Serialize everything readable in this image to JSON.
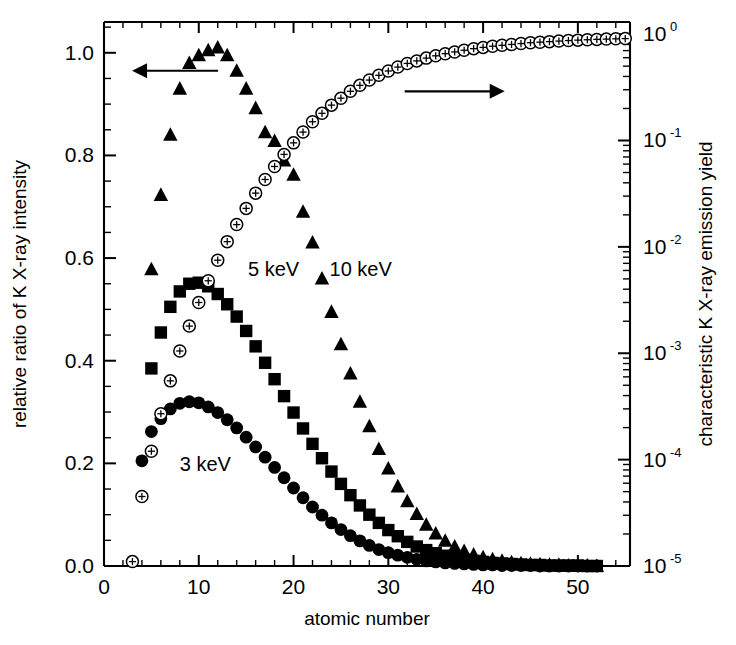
{
  "chart_data": {
    "type": "scatter",
    "title": "",
    "xlabel": "atomic number",
    "ylabel": "relative ratio of K X-ray intensity",
    "y2label": "characteristic K X-ray emission yield",
    "xlim": [
      0,
      55.5
    ],
    "xticks": [
      0,
      10,
      20,
      30,
      40,
      50
    ],
    "xticklabels": [
      "0",
      "10",
      "20",
      "30",
      "40",
      "50"
    ],
    "x_minor_step": 2,
    "ylim": [
      0.0,
      1.06
    ],
    "yticks": [
      0.0,
      0.2,
      0.4,
      0.6,
      0.8,
      1.0
    ],
    "yticklabels": [
      "0.0",
      "0.2",
      "0.4",
      "0.6",
      "0.8",
      "1.0"
    ],
    "y_minor_step": 0.05,
    "y2_log": true,
    "y2lim": [
      1e-05,
      1.3
    ],
    "y2ticks": [
      1e-05,
      0.0001,
      0.001,
      0.01,
      0.1,
      1
    ],
    "y2ticklabels": [
      "10-5",
      "10-4",
      "10-3",
      "10-2",
      "10-1",
      "100"
    ],
    "y2tick_mantissas": [
      "10",
      "10",
      "10",
      "10",
      "10",
      "10"
    ],
    "y2tick_exponents": [
      "-5",
      "-4",
      "-3",
      "-2",
      "-1",
      "0"
    ],
    "grid": false,
    "legend_position": "inline-annotations",
    "annotations": [
      {
        "name": "left-axis-arrow",
        "text": "",
        "symbol": "arrow-left",
        "x_data": 7.5,
        "y_data": 0.965,
        "length_px": 86
      },
      {
        "name": "right-axis-arrow",
        "text": "",
        "symbol": "arrow-right",
        "x_data": 37.0,
        "y_data": 0.925,
        "length_px": 100
      }
    ],
    "series": [
      {
        "name": "3 keV",
        "label": "3 keV",
        "marker": "filled-circle",
        "axis": "left",
        "color": "#000000",
        "label_x_data": 8.0,
        "label_y_data": 0.185,
        "x": [
          4,
          5,
          6,
          7,
          8,
          9,
          10,
          11,
          12,
          13,
          14,
          15,
          16,
          17,
          18,
          19,
          20,
          21,
          22,
          23,
          24,
          25,
          26,
          27,
          28,
          29,
          30,
          31,
          32,
          33,
          34,
          35,
          36,
          37,
          38,
          39,
          40,
          41,
          42,
          43,
          44,
          45,
          46,
          47,
          48,
          49,
          50,
          51,
          52
        ],
        "y": [
          0.205,
          0.262,
          0.287,
          0.306,
          0.317,
          0.32,
          0.318,
          0.31,
          0.299,
          0.285,
          0.269,
          0.251,
          0.232,
          0.212,
          0.192,
          0.172,
          0.152,
          0.133,
          0.115,
          0.099,
          0.084,
          0.071,
          0.059,
          0.049,
          0.04,
          0.032,
          0.026,
          0.021,
          0.017,
          0.013,
          0.01,
          0.008,
          0.006,
          0.005,
          0.004,
          0.003,
          0.002,
          0.002,
          0.001,
          0.001,
          0.001,
          0.001,
          0.0,
          0.0,
          0.0,
          0.0,
          0.0,
          0.0,
          0.0
        ]
      },
      {
        "name": "5 keV",
        "label": "5 keV",
        "marker": "filled-square",
        "axis": "left",
        "color": "#000000",
        "label_x_data": 15.2,
        "label_y_data": 0.565,
        "x": [
          5,
          6,
          7,
          8,
          9,
          10,
          11,
          12,
          13,
          14,
          15,
          16,
          17,
          18,
          19,
          20,
          21,
          22,
          23,
          24,
          25,
          26,
          27,
          28,
          29,
          30,
          31,
          32,
          33,
          34,
          35,
          36,
          37,
          38,
          39,
          40,
          41,
          42,
          43,
          44,
          45,
          46,
          47,
          48,
          49,
          50,
          51,
          52
        ],
        "y": [
          0.385,
          0.455,
          0.505,
          0.535,
          0.55,
          0.552,
          0.545,
          0.53,
          0.51,
          0.486,
          0.458,
          0.428,
          0.396,
          0.364,
          0.331,
          0.299,
          0.268,
          0.238,
          0.21,
          0.184,
          0.16,
          0.138,
          0.118,
          0.1,
          0.084,
          0.07,
          0.058,
          0.047,
          0.038,
          0.031,
          0.025,
          0.02,
          0.016,
          0.012,
          0.01,
          0.008,
          0.006,
          0.005,
          0.004,
          0.003,
          0.002,
          0.002,
          0.001,
          0.001,
          0.001,
          0.001,
          0.0,
          0.0
        ]
      },
      {
        "name": "10 keV",
        "label": "10 keV",
        "marker": "filled-triangle",
        "axis": "left",
        "color": "#000000",
        "label_x_data": 23.8,
        "label_y_data": 0.565,
        "x": [
          5,
          6,
          7,
          8,
          9,
          10,
          11,
          12,
          13,
          14,
          15,
          16,
          17,
          18,
          19,
          20,
          21,
          22,
          23,
          24,
          25,
          26,
          27,
          28,
          29,
          30,
          31,
          32,
          33,
          34,
          35,
          36,
          37,
          38,
          39,
          40,
          41,
          42,
          43,
          44,
          45,
          46,
          47,
          48,
          49,
          50,
          51,
          52
        ],
        "y": [
          0.578,
          0.723,
          0.84,
          0.93,
          0.98,
          0.995,
          1.005,
          1.01,
          0.995,
          0.965,
          0.93,
          0.892,
          0.845,
          0.828,
          0.79,
          0.762,
          0.69,
          0.63,
          0.56,
          0.495,
          0.432,
          0.375,
          0.32,
          0.272,
          0.228,
          0.19,
          0.155,
          0.126,
          0.101,
          0.08,
          0.063,
          0.049,
          0.038,
          0.029,
          0.022,
          0.017,
          0.013,
          0.01,
          0.007,
          0.005,
          0.004,
          0.003,
          0.002,
          0.002,
          0.001,
          0.001,
          0.001,
          0.0
        ]
      },
      {
        "name": "K X-ray emission yield",
        "label": "",
        "marker": "open-circle-cross",
        "axis": "right",
        "color": "#000000",
        "x": [
          3,
          4,
          5,
          6,
          7,
          8,
          9,
          10,
          11,
          12,
          13,
          14,
          15,
          16,
          17,
          18,
          19,
          20,
          21,
          22,
          23,
          24,
          25,
          26,
          27,
          28,
          29,
          30,
          31,
          32,
          33,
          34,
          35,
          36,
          37,
          38,
          39,
          40,
          41,
          42,
          43,
          44,
          45,
          46,
          47,
          48,
          49,
          50,
          51,
          52,
          53,
          54,
          55
        ],
        "y": [
          1.1e-05,
          4.5e-05,
          0.00012,
          0.00027,
          0.00055,
          0.00105,
          0.0018,
          0.003,
          0.0048,
          0.0075,
          0.0112,
          0.0162,
          0.023,
          0.032,
          0.043,
          0.057,
          0.074,
          0.095,
          0.12,
          0.15,
          0.18,
          0.215,
          0.25,
          0.29,
          0.33,
          0.37,
          0.41,
          0.45,
          0.49,
          0.53,
          0.56,
          0.595,
          0.625,
          0.655,
          0.68,
          0.705,
          0.73,
          0.75,
          0.77,
          0.785,
          0.8,
          0.815,
          0.83,
          0.84,
          0.85,
          0.86,
          0.87,
          0.878,
          0.885,
          0.892,
          0.898,
          0.903,
          0.908
        ]
      }
    ]
  },
  "axes": {
    "x_title": "atomic number",
    "y_left_title": "relative ratio of K X-ray intensity",
    "y_right_title": "characteristic K X-ray emission yield"
  }
}
